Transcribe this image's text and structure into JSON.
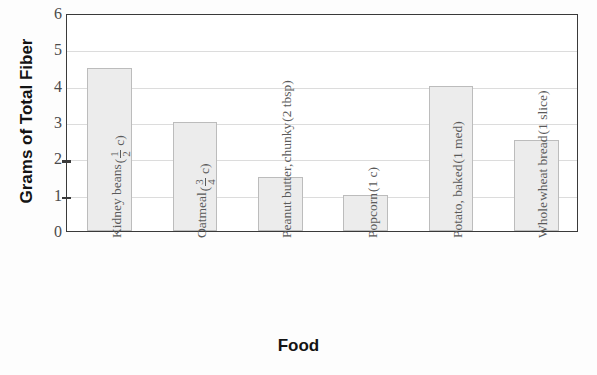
{
  "chart_data": {
    "type": "bar",
    "title": "",
    "xlabel": "Food",
    "ylabel": "Grams of Total Fiber",
    "ylim": [
      0,
      6
    ],
    "yticks": [
      0,
      1,
      2,
      3,
      4,
      5,
      6
    ],
    "ytick_labels": [
      "0",
      "1",
      "2",
      "3",
      "4",
      "5",
      "6"
    ],
    "grid": true,
    "legend": "none",
    "categories": [
      "Kidney beans (1/2 c)",
      "Oatmeal (3/4 c)",
      "Peanut butter, chunky (2 tbsp)",
      "Popcorn (1 c)",
      "Potato, baked (1 med)",
      "Whole wheat bread (1 slice)"
    ],
    "values": [
      4.5,
      3.0,
      1.5,
      1.0,
      4.0,
      2.5
    ],
    "bar_fill_color": "#ececec",
    "bar_edge_color": "#bcbcbc",
    "grid_color": "#dcdcdc",
    "axis_color": "#3a3a3a"
  },
  "axis": {
    "y_title": "Grams of Total Fiber",
    "x_title": "Food",
    "y_tick_labels": [
      "6",
      "5",
      "4",
      "3",
      "2",
      "1",
      "0"
    ]
  },
  "categories": [
    {
      "id": "kidney-beans",
      "lines": [
        "Kidney beans"
      ],
      "amount_prefix": "(",
      "amount_num": "1",
      "amount_den": "2",
      "amount_suffix": " c)",
      "value": 4.5
    },
    {
      "id": "oatmeal",
      "lines": [
        "Oatmeal"
      ],
      "amount_prefix": "(",
      "amount_num": "3",
      "amount_den": "4",
      "amount_suffix": " c)",
      "value": 3.0
    },
    {
      "id": "peanut-butter-chunky",
      "lines": [
        "Peanut butter,",
        "chunky"
      ],
      "amount_plain": "(2 tbsp)",
      "value": 1.5
    },
    {
      "id": "popcorn",
      "lines": [
        "Popcorn"
      ],
      "amount_plain": "(1 c)",
      "value": 1.0
    },
    {
      "id": "potato-baked",
      "lines": [
        "Potato, baked"
      ],
      "amount_plain": "(1 med)",
      "value": 4.0
    },
    {
      "id": "whole-wheat-bread",
      "lines": [
        "Whole",
        "wheat bread"
      ],
      "amount_plain": "(1 slice)",
      "value": 2.5
    }
  ]
}
